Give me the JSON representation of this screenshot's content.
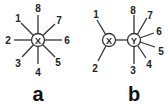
{
  "diagrams": [
    {
      "caption": "a",
      "nodes": [
        {
          "id": "X",
          "label": "X",
          "x": 38,
          "y": 40
        }
      ],
      "edges": [
        {
          "label": "1",
          "from": "X",
          "lx": 21,
          "ly": 23,
          "tx": 18,
          "ty": 22
        },
        {
          "label": "2",
          "from": "X",
          "lx": 14,
          "ly": 40,
          "tx": 8,
          "ty": 44
        },
        {
          "label": "3",
          "from": "X",
          "lx": 22,
          "ly": 57,
          "tx": 17,
          "ty": 66
        },
        {
          "label": "4",
          "from": "X",
          "lx": 38,
          "ly": 64,
          "tx": 35,
          "ty": 75
        },
        {
          "label": "5",
          "from": "X",
          "lx": 55,
          "ly": 57,
          "tx": 56,
          "ty": 65
        },
        {
          "label": "6",
          "from": "X",
          "lx": 62,
          "ly": 40,
          "tx": 63,
          "ty": 44
        },
        {
          "label": "7",
          "from": "X",
          "lx": 55,
          "ly": 24,
          "tx": 56,
          "ty": 24
        },
        {
          "label": "8",
          "from": "X",
          "lx": 38,
          "ly": 15,
          "tx": 35,
          "ty": 14
        }
      ]
    },
    {
      "caption": "b",
      "nodes": [
        {
          "id": "X",
          "label": "X",
          "x": 109,
          "y": 40
        },
        {
          "id": "Y",
          "label": "Y",
          "x": 134,
          "y": 40
        }
      ],
      "edges": [
        {
          "label": "1",
          "from": "X",
          "lx": 98,
          "ly": 21,
          "tx": 92,
          "ty": 17
        },
        {
          "label": "2",
          "from": "X",
          "lx": 98,
          "ly": 60,
          "tx": 91,
          "ty": 72
        },
        {
          "label": "8",
          "from": "Y",
          "lx": 133,
          "ly": 16,
          "tx": 130,
          "ty": 14
        },
        {
          "label": "7",
          "from": "Y",
          "lx": 146,
          "ly": 19,
          "tx": 147,
          "ty": 19
        },
        {
          "label": "6",
          "from": "Y",
          "lx": 153,
          "ly": 33,
          "tx": 156,
          "ty": 35
        },
        {
          "label": "5",
          "from": "Y",
          "lx": 154,
          "ly": 47,
          "tx": 158,
          "ty": 55
        },
        {
          "label": "4",
          "from": "Y",
          "lx": 145,
          "ly": 58,
          "tx": 146,
          "ty": 68
        },
        {
          "label": "3",
          "from": "Y",
          "lx": 133,
          "ly": 64,
          "tx": 130,
          "ty": 75
        }
      ],
      "links": [
        {
          "from": "X",
          "to": "Y"
        }
      ]
    }
  ]
}
